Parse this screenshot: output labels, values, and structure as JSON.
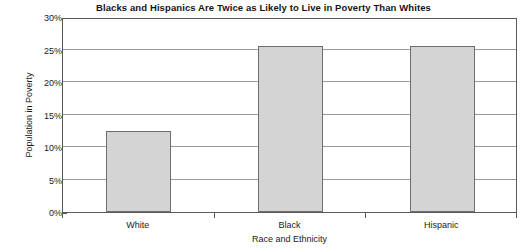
{
  "chart_data": {
    "type": "bar",
    "title": "Blacks and Hispanics Are Twice as Likely to Live in Poverty Than Whites",
    "xlabel": "Race and Ethnicity",
    "ylabel": "Population in Poverty",
    "categories": [
      "White",
      "Black",
      "Hispanic"
    ],
    "values": [
      12.4,
      25.6,
      25.6
    ],
    "value_labels": [
      "12.4%",
      "25.6%",
      "25.6%"
    ],
    "ylim": [
      0,
      30
    ],
    "y_ticks": [
      0,
      5,
      10,
      15,
      20,
      25,
      30
    ],
    "y_tick_labels": [
      "0%",
      "5%",
      "10%",
      "15%",
      "20%",
      "25%",
      "30%"
    ],
    "grid": true,
    "grid_axis": "y",
    "legend": false,
    "legend_position": "none",
    "bar_fill_color": "#d4d4d4",
    "bar_border_color": "#6e6e6e",
    "axis_color": "#5a5a5a",
    "gridline_color": "#9a9a9a",
    "background_color": "#ffffff",
    "text_color": "#1a1a1a"
  }
}
